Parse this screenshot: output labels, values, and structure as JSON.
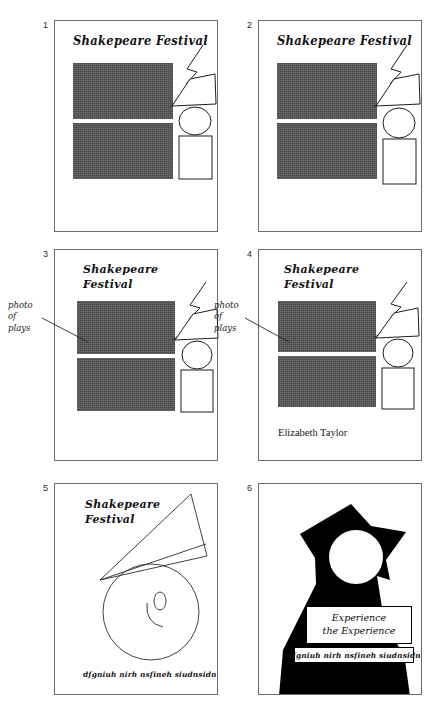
{
  "document": {
    "type": "storyboard",
    "title": "Shakespeare Festival poster storyboard",
    "panel_count": 6
  },
  "text": {
    "poster_title_one_line": "Shakepeare Festival",
    "poster_title_two_line": "Shakepeare\nFestival",
    "callout_label": "photo of\nplays",
    "credit": "Elizabeth Taylor",
    "tagline": "dfgniuh nirh nsfineh siudnsidn",
    "headline": "Experience\nthe Experience"
  },
  "panels": [
    {
      "number": "1",
      "title": "Shakepeare Festival",
      "title_layout": "one-line",
      "has_photo_blocks": true,
      "has_figure": true,
      "has_callout": false,
      "credit": "",
      "tagline": "",
      "style": "line-art"
    },
    {
      "number": "2",
      "title": "Shakepeare Festival",
      "title_layout": "one-line",
      "has_photo_blocks": true,
      "has_figure": true,
      "has_callout": false,
      "credit": "",
      "tagline": "",
      "style": "line-art"
    },
    {
      "number": "3",
      "title": "Shakepeare\nFestival",
      "title_layout": "two-line",
      "has_photo_blocks": true,
      "has_figure": true,
      "has_callout": true,
      "callout": "photo of\nplays",
      "credit": "",
      "tagline": "",
      "style": "line-art"
    },
    {
      "number": "4",
      "title": "Shakepeare\nFestival",
      "title_layout": "two-line",
      "has_photo_blocks": true,
      "has_figure": true,
      "has_callout": true,
      "callout": "photo of\nplays",
      "credit": "Elizabeth Taylor",
      "tagline": "",
      "style": "line-art"
    },
    {
      "number": "5",
      "title": "Shakepeare\nFestival",
      "title_layout": "two-line",
      "has_photo_blocks": false,
      "has_figure": false,
      "has_callout": false,
      "credit": "",
      "tagline": "dfgniuh nirh nsfineh siudnsidn",
      "style": "sketch"
    },
    {
      "number": "6",
      "title": "",
      "title_layout": "none",
      "has_photo_blocks": false,
      "has_figure": false,
      "has_callout": false,
      "headline": "Experience\nthe Experience",
      "tagline": "dfgniuh nirh nsfineh siudnsidn",
      "style": "silhouette"
    }
  ],
  "colors": {
    "page_background": "#ffffff",
    "panel_border": "#6b6b6b",
    "photo_block_fill": "#4a4a4a",
    "ink": "#1d1d1d",
    "silhouette_fill": "#000000"
  }
}
